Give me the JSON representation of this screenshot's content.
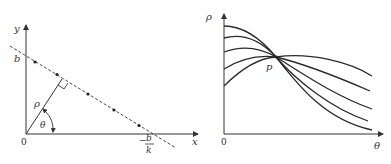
{
  "colors": {
    "ink": "#333333",
    "background": "#ffffff"
  },
  "left_panel": {
    "description": "Image space: a straight line y = kx + b with normal distance rho and angle theta",
    "axis_labels": {
      "x": "x",
      "y": "y",
      "origin": "0"
    },
    "intercept_labels": {
      "y_intercept": "b",
      "x_intercept_numerator": "b",
      "x_intercept_denominator": "k",
      "x_intercept_sign": "−"
    },
    "normal_label": "ρ",
    "angle_label": "θ",
    "points_on_line": 5
  },
  "right_panel": {
    "description": "Parameter (Hough) space: sinusoidal curves in rho-theta intersect at a common point p",
    "axis_labels": {
      "x": "θ",
      "y": "ρ",
      "origin": "0"
    },
    "intersection_label": "p",
    "curve_count": 5
  }
}
